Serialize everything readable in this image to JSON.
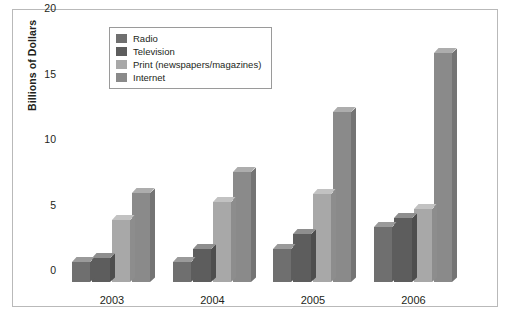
{
  "chart_data": {
    "type": "bar",
    "title": "",
    "subtitle": "",
    "xlabel": "",
    "ylabel": "Billions of Dollars",
    "categories": [
      "2003",
      "2004",
      "2005",
      "2006"
    ],
    "series": [
      {
        "name": "Radio",
        "color": "#6f6f6f",
        "values": [
          1.5,
          1.5,
          2.5,
          4.2
        ]
      },
      {
        "name": "Television",
        "color": "#5d5d5d",
        "values": [
          1.8,
          2.5,
          3.7,
          4.9
        ]
      },
      {
        "name": "Print (newspapers/magazines)",
        "color": "#a8a8a8",
        "values": [
          4.7,
          6.1,
          6.7,
          5.6
        ]
      },
      {
        "name": "Internet",
        "color": "#8a8a8a",
        "values": [
          6.8,
          8.4,
          13.0,
          17.5
        ]
      }
    ],
    "ylim": [
      0,
      20
    ],
    "yticks": [
      "20",
      "15",
      "10",
      "5",
      "0"
    ],
    "ytick_values": [
      20,
      15,
      10,
      5,
      0
    ],
    "grid": false,
    "legend_position": "top-left",
    "style": "3d-bars"
  },
  "legend": {
    "entries": [
      {
        "label": "Radio"
      },
      {
        "label": "Television"
      },
      {
        "label": "Print (newspapers/magazines)"
      },
      {
        "label": "Internet"
      }
    ]
  },
  "axes": {
    "y_title": "Billions of Dollars"
  }
}
